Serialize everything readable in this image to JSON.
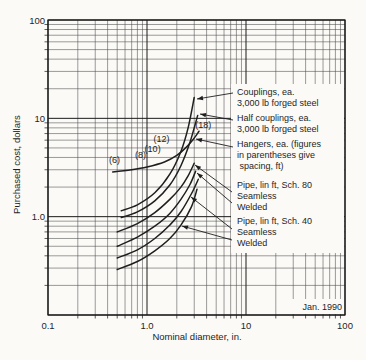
{
  "figure": {
    "kind": "log-log cost chart (scanned book figure)"
  },
  "colors": {
    "ink": "#1f1f1f",
    "paper": "#fbfaf7",
    "grid_minor": "#4a4a4a",
    "grid_major": "#1a1a1a"
  },
  "chart_data": {
    "type": "line",
    "title": "",
    "x_axis": {
      "label": "Nominal diameter, in.",
      "scale": "log",
      "range": [
        0.1,
        100
      ],
      "ticks": [
        {
          "v": 0.1,
          "t": "0.1"
        },
        {
          "v": 1,
          "t": "1.0"
        },
        {
          "v": 10,
          "t": "10"
        },
        {
          "v": 100,
          "t": "100"
        }
      ]
    },
    "y_axis": {
      "label": "Purchased cost, dollars",
      "scale": "log",
      "range": [
        0.1,
        100
      ],
      "ticks": [
        {
          "v": 100,
          "t": "100"
        },
        {
          "v": 10,
          "t": "10"
        },
        {
          "v": 1,
          "t": "1.0"
        }
      ]
    },
    "grid": "full log minor + major gridlines, both axes",
    "legend_position": "right inset, white panel with leader arrows",
    "annotation": "Jan. 1990",
    "series": [
      {
        "id": "couplings",
        "name": "Couplings, ea. 3,000 lb forged steel",
        "points": [
          [
            0.55,
            1.15
          ],
          [
            0.8,
            1.32
          ],
          [
            1.2,
            1.75
          ],
          [
            1.7,
            2.7
          ],
          [
            2.2,
            4.6
          ],
          [
            2.6,
            8.0
          ],
          [
            3.0,
            16.3
          ]
        ]
      },
      {
        "id": "half_couplings",
        "name": "Half couplings, ea. 3,000 lb forged steel",
        "points": [
          [
            0.55,
            0.98
          ],
          [
            0.8,
            1.12
          ],
          [
            1.2,
            1.45
          ],
          [
            1.7,
            2.1
          ],
          [
            2.2,
            3.3
          ],
          [
            2.7,
            5.6
          ],
          [
            3.25,
            10.7
          ]
        ]
      },
      {
        "id": "hangers",
        "name": "Hangers, ea. (figures in parentheses give spacing, ft)",
        "points": [
          [
            0.45,
            2.85
          ],
          [
            0.7,
            3.0
          ],
          [
            1.0,
            3.2
          ],
          [
            1.5,
            3.6
          ],
          [
            2.0,
            4.2
          ],
          [
            2.5,
            5.1
          ],
          [
            3.0,
            6.3
          ],
          [
            3.35,
            7.4
          ]
        ]
      },
      {
        "id": "pipe_sch80_seamless",
        "name": "Pipe, lin ft, Sch. 80 Seamless",
        "points": [
          [
            0.5,
            0.7
          ],
          [
            0.8,
            0.85
          ],
          [
            1.2,
            1.1
          ],
          [
            1.7,
            1.5
          ],
          [
            2.2,
            2.0
          ],
          [
            2.6,
            2.6
          ],
          [
            3.0,
            3.5
          ]
        ]
      },
      {
        "id": "pipe_sch80_welded",
        "name": "Pipe, lin ft, Sch. 80 Welded",
        "points": [
          [
            0.5,
            0.5
          ],
          [
            0.8,
            0.62
          ],
          [
            1.2,
            0.8
          ],
          [
            1.7,
            1.08
          ],
          [
            2.2,
            1.5
          ],
          [
            2.7,
            2.1
          ],
          [
            3.1,
            2.9
          ]
        ]
      },
      {
        "id": "pipe_sch40_seamless",
        "name": "Pipe, lin ft, Sch. 40 Seamless",
        "points": [
          [
            0.5,
            0.38
          ],
          [
            0.8,
            0.46
          ],
          [
            1.2,
            0.6
          ],
          [
            1.7,
            0.82
          ],
          [
            2.2,
            1.12
          ],
          [
            2.8,
            1.7
          ],
          [
            3.3,
            2.4
          ]
        ]
      },
      {
        "id": "pipe_sch40_welded",
        "name": "Pipe, lin ft, Sch. 40 Welded",
        "points": [
          [
            0.5,
            0.29
          ],
          [
            0.8,
            0.35
          ],
          [
            1.2,
            0.45
          ],
          [
            1.7,
            0.6
          ],
          [
            2.2,
            0.82
          ],
          [
            2.8,
            1.25
          ],
          [
            3.2,
            1.9
          ]
        ]
      }
    ],
    "hanger_spacing_labels": [
      {
        "text": "(6)",
        "d": 0.47,
        "cost": 3.8
      },
      {
        "text": "(8)",
        "d": 0.86,
        "cost": 4.2
      },
      {
        "text": "(10)",
        "d": 1.14,
        "cost": 4.9
      },
      {
        "text": "(12)",
        "d": 1.4,
        "cost": 6.1
      },
      {
        "text": "(18)",
        "d": 3.7,
        "cost": 8.5
      }
    ],
    "callouts": [
      {
        "id": "couplings",
        "lines": [
          "Couplings, ea.",
          "3,000 lb forged steel"
        ],
        "top": 87,
        "arrows": [
          {
            "tail": [
              233,
              93
            ],
            "tip": [
              197,
              99
            ]
          }
        ]
      },
      {
        "id": "half_couplings",
        "lines": [
          "Half couplings, ea.",
          "3,000 lb forged steel"
        ],
        "top": 113,
        "arrows": [
          {
            "tail": [
              233,
              120
            ],
            "tip": [
              200,
              114
            ]
          }
        ]
      },
      {
        "id": "hangers",
        "lines": [
          "Hangers, ea. (figures",
          "in parentheses give",
          " spacing, ft)"
        ],
        "top": 139,
        "arrows": [
          {
            "tail": [
              233,
              147
            ],
            "tip": [
              196,
              139
            ]
          }
        ]
      },
      {
        "id": "pipe_sch80",
        "lines": [
          "Pipe, lin ft, Sch. 80",
          "Seamless",
          "Welded"
        ],
        "top": 180,
        "arrows": [
          {
            "tail": [
              232,
              192
            ],
            "tip": [
              195,
              165
            ]
          },
          {
            "tail": [
              232,
              203
            ],
            "tip": [
              197,
              173
            ]
          }
        ]
      },
      {
        "id": "pipe_sch40",
        "lines": [
          "Pipe, lin ft, Sch. 40",
          "Seamless",
          "Welded"
        ],
        "top": 216,
        "arrows": [
          {
            "tail": [
              232,
              229
            ],
            "tip": [
              191,
              197
            ]
          },
          {
            "tail": [
              232,
              240
            ],
            "tip": [
              182,
              226
            ]
          }
        ]
      }
    ]
  },
  "layout": {
    "plot": {
      "left": 48,
      "top": 20,
      "right": 345,
      "bottom": 315
    },
    "legend_mask": {
      "x": 231,
      "y": 84,
      "w": 113,
      "h": 169
    },
    "date_mask": {
      "x": 282,
      "y": 299,
      "w": 62,
      "h": 15
    }
  }
}
